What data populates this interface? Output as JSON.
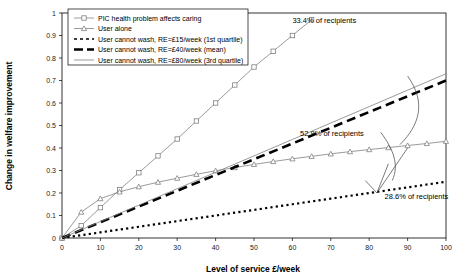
{
  "chart_data": {
    "type": "line",
    "title": "",
    "xlabel": "Level of service £/week",
    "ylabel": "Change in welfare improvement",
    "xlim": [
      0,
      100
    ],
    "ylim": [
      0,
      1
    ],
    "xticks": [
      0,
      10,
      20,
      30,
      40,
      50,
      60,
      70,
      80,
      90,
      100
    ],
    "yticks": [
      0,
      0.1,
      0.2,
      0.3,
      0.4,
      0.5,
      0.6,
      0.7,
      0.8,
      0.9,
      1
    ],
    "grid": false,
    "legend_position": "top-center",
    "x": [
      0,
      5,
      10,
      15,
      20,
      25,
      30,
      35,
      40,
      45,
      50,
      55,
      60,
      65,
      70,
      75,
      80,
      85,
      90,
      95,
      100
    ],
    "series": [
      {
        "name": "PIC health problem affects caring",
        "marker": "square",
        "style": "thin-solid-marker",
        "color": "#808080",
        "x": [
          0,
          5,
          10,
          15,
          20,
          25,
          30,
          35,
          40,
          45,
          50,
          55,
          60,
          65
        ],
        "values": [
          0.0,
          0.055,
          0.135,
          0.215,
          0.29,
          0.365,
          0.44,
          0.52,
          0.6,
          0.68,
          0.76,
          0.83,
          0.9,
          0.97
        ]
      },
      {
        "name": "User alone",
        "marker": "triangle",
        "style": "thin-solid-marker",
        "color": "#808080",
        "x": [
          0,
          5,
          10,
          15,
          20,
          25,
          30,
          35,
          40,
          45,
          50,
          55,
          60,
          65,
          70,
          75,
          80,
          85,
          90,
          95,
          100
        ],
        "values": [
          0.0,
          0.115,
          0.175,
          0.205,
          0.228,
          0.248,
          0.266,
          0.283,
          0.299,
          0.313,
          0.327,
          0.34,
          0.352,
          0.363,
          0.374,
          0.384,
          0.393,
          0.402,
          0.411,
          0.42,
          0.43
        ]
      },
      {
        "name": "User cannot wash, RE=£15/week (1st quartile)",
        "marker": "none",
        "style": "dotted",
        "color": "#000000",
        "x": [
          0,
          10,
          20,
          30,
          40,
          50,
          60,
          70,
          80,
          90,
          100
        ],
        "values": [
          0.0,
          0.025,
          0.05,
          0.075,
          0.1,
          0.125,
          0.15,
          0.175,
          0.2,
          0.225,
          0.25
        ]
      },
      {
        "name": "User cannot wash, RE=£40/week (mean)",
        "marker": "none",
        "style": "thick-dashed",
        "color": "#000000",
        "x": [
          0,
          10,
          20,
          30,
          40,
          50,
          60,
          70,
          80,
          90,
          100
        ],
        "values": [
          0.0,
          0.07,
          0.14,
          0.21,
          0.28,
          0.35,
          0.42,
          0.49,
          0.56,
          0.63,
          0.7
        ]
      },
      {
        "name": "User cannot wash, RE=£80/week (3rd quartile)",
        "marker": "none",
        "style": "thin-solid",
        "color": "#808080",
        "x": [
          0,
          10,
          20,
          30,
          40,
          50,
          60,
          70,
          80,
          90,
          100
        ],
        "values": [
          0.0,
          0.073,
          0.146,
          0.219,
          0.292,
          0.365,
          0.438,
          0.511,
          0.584,
          0.657,
          0.73
        ]
      }
    ],
    "annotations": [
      {
        "text": "33.4% of recipients",
        "x": 60,
        "y": 0.955
      },
      {
        "text": "52.9% of recipients",
        "x": 62,
        "y": 0.455
      },
      {
        "text": "28.6% of recipients",
        "x": 84,
        "y": 0.175
      }
    ]
  },
  "legend": {
    "entries": [
      {
        "label": "PIC health problem affects caring"
      },
      {
        "label": "User alone"
      },
      {
        "label": "User cannot wash, RE=£15/week (1st quartile)"
      },
      {
        "label": "User cannot wash, RE=£40/week (mean)"
      },
      {
        "label": "User cannot wash, RE=£80/week (3rd quartile)"
      }
    ]
  },
  "axes": {
    "x_label": "Level of service £/week",
    "y_label": "Change in welfare improvement",
    "x_ticks": [
      "0",
      "10",
      "20",
      "30",
      "40",
      "50",
      "60",
      "70",
      "80",
      "90",
      "100"
    ],
    "y_ticks": [
      "0",
      "0.1",
      "0.2",
      "0.3",
      "0.4",
      "0.5",
      "0.6",
      "0.7",
      "0.8",
      "0.9",
      "1"
    ]
  }
}
